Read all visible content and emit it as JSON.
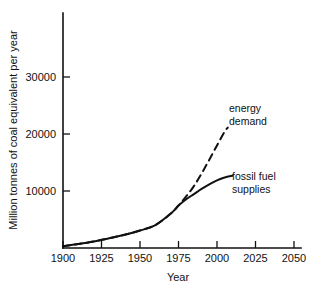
{
  "chart_data": {
    "type": "line",
    "title": "",
    "xlabel": "Year",
    "ylabel": "Million tonnes of coal equivalent per year",
    "xlim": [
      1900,
      2055
    ],
    "ylim": [
      0,
      41000
    ],
    "grid": false,
    "legend": "annotations-on-plot",
    "xticks": [
      1900,
      1925,
      1950,
      1975,
      2000,
      2025,
      2050
    ],
    "xtick_labels": [
      "1900",
      "1925",
      "1950",
      "1975",
      "2000",
      "2025",
      "2050"
    ],
    "yticks": [
      10000,
      20000,
      30000
    ],
    "ytick_labels": [
      "10000",
      "20000",
      "30000"
    ],
    "series": [
      {
        "name": "energy demand",
        "style": "dashed",
        "color": "#111111",
        "x": [
          1900,
          1910,
          1920,
          1930,
          1940,
          1950,
          1960,
          1970,
          1975,
          1980,
          1985,
          1990,
          1995,
          2000,
          2005,
          2007
        ],
        "values": [
          300,
          700,
          1150,
          1700,
          2300,
          3050,
          4000,
          6000,
          7400,
          9000,
          10800,
          13000,
          15400,
          17900,
          20300,
          21000
        ]
      },
      {
        "name": "fossil fuel supplies",
        "style": "solid",
        "color": "#111111",
        "x": [
          1900,
          1910,
          1920,
          1930,
          1940,
          1950,
          1960,
          1970,
          1975,
          1980,
          1985,
          1990,
          1995,
          2000,
          2005,
          2010
        ],
        "values": [
          300,
          700,
          1150,
          1700,
          2300,
          3050,
          4000,
          6000,
          7400,
          8500,
          9400,
          10300,
          11100,
          11800,
          12300,
          12600
        ]
      }
    ],
    "annotations": [
      {
        "name": "energy-demand-label",
        "lines": [
          "energy",
          "demand"
        ],
        "x": 2012,
        "y": 27000
      },
      {
        "name": "fossil-fuel-supplies-label",
        "lines": [
          "fossil fuel",
          "supplies"
        ],
        "x": 2014,
        "y": 13500
      }
    ]
  }
}
